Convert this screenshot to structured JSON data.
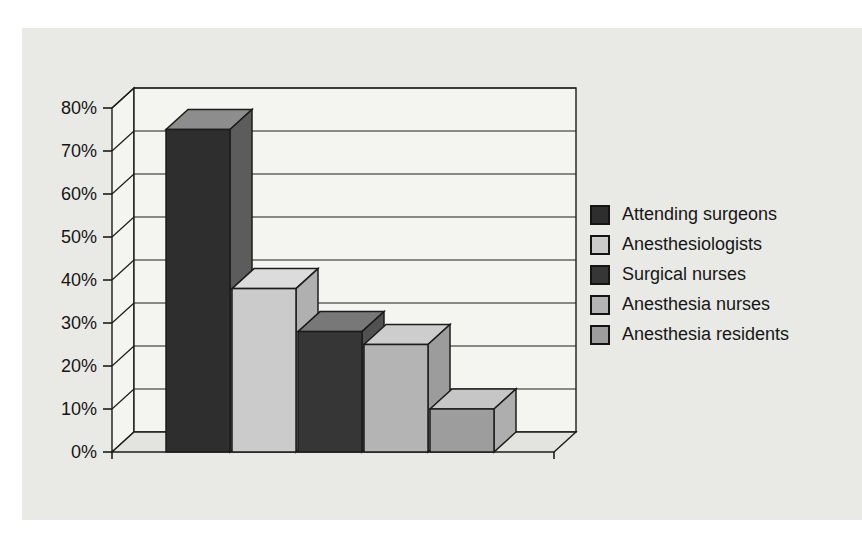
{
  "figure": {
    "panel_bg": "#e9e9e6",
    "wall_color": "#f4f4f1",
    "floor_color": "#e3e3e0",
    "line_color": "#1c1c1c",
    "text_color": "#161616"
  },
  "chart_data": {
    "type": "bar",
    "projection": "3d",
    "title": "",
    "xlabel": "",
    "ylabel": "",
    "categories": [
      "Attending surgeons",
      "Anesthesiologists",
      "Surgical nurses",
      "Anesthesia nurses",
      "Anesthesia residents"
    ],
    "values": [
      75,
      38,
      28,
      25,
      10
    ],
    "value_unit": "%",
    "ylim": [
      0,
      80
    ],
    "ytick_step": 10,
    "ytick_labels": [
      "0%",
      "10%",
      "20%",
      "30%",
      "40%",
      "50%",
      "60%",
      "70%",
      "80%"
    ],
    "grid": true,
    "legend_position": "right",
    "bar_colors": [
      {
        "front": "#2e2e2e",
        "side": "#5c5c5c",
        "top": "#8d8d8d"
      },
      {
        "front": "#cbcbcb",
        "side": "#b0b0b0",
        "top": "#dcdcdc"
      },
      {
        "front": "#363636",
        "side": "#515151",
        "top": "#787878"
      },
      {
        "front": "#b4b4b4",
        "side": "#9c9c9c",
        "top": "#cdcdcd"
      },
      {
        "front": "#9d9d9d",
        "side": "#aeaeae",
        "top": "#c6c6c6"
      }
    ]
  },
  "legend": {
    "items": [
      {
        "label": "Attending surgeons",
        "color": "#2e2e2e"
      },
      {
        "label": "Anesthesiologists",
        "color": "#cbcbcb"
      },
      {
        "label": "Surgical nurses",
        "color": "#363636"
      },
      {
        "label": "Anesthesia nurses",
        "color": "#b4b4b4"
      },
      {
        "label": "Anesthesia residents",
        "color": "#9d9d9d"
      }
    ]
  }
}
